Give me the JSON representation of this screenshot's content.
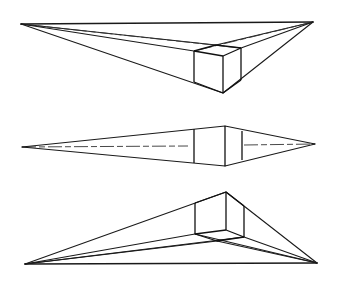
{
  "diagram": {
    "title": "",
    "line_color": "#1a1a1a",
    "background": "#ffffff",
    "figures": [
      {
        "name": "cube-below-horizon",
        "vp_left": [
          21,
          24
        ],
        "vp_right": [
          313,
          22
        ],
        "cube": {
          "top_back": [
            216,
            45
          ],
          "top_left": [
            194,
            51
          ],
          "top_front": [
            223,
            56
          ],
          "top_right": [
            241,
            48
          ],
          "bottom_left": [
            194,
            82
          ],
          "bottom_front": [
            223,
            93
          ],
          "bottom_right": [
            241,
            80
          ]
        }
      },
      {
        "name": "cube-on-horizon",
        "vp_left": [
          22,
          147
        ],
        "vp_right": [
          315,
          144
        ],
        "cube": {
          "top_left": [
            194,
            129
          ],
          "top_front": [
            225,
            126
          ],
          "top_right": [
            242,
            131
          ],
          "bottom_left": [
            194,
            163
          ],
          "bottom_front": [
            225,
            166
          ],
          "bottom_right": [
            242,
            160
          ]
        }
      },
      {
        "name": "cube-above-horizon",
        "vp_left": [
          25,
          264
        ],
        "vp_right": [
          317,
          263
        ],
        "cube": {
          "top_left": [
            195,
            203
          ],
          "top_front": [
            226,
            192
          ],
          "top_right": [
            244,
            206
          ],
          "bottom_left": [
            195,
            234
          ],
          "bottom_front": [
            226,
            230
          ],
          "bottom_right": [
            244,
            237
          ],
          "bottom_back": [
            217,
            241
          ]
        }
      }
    ]
  }
}
